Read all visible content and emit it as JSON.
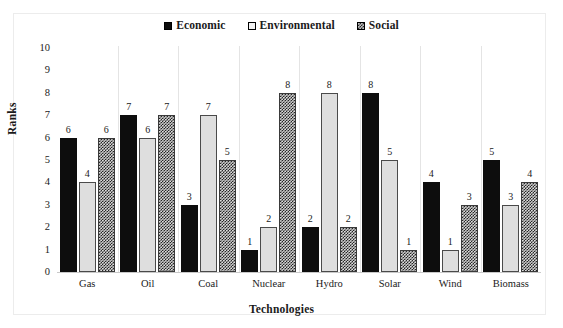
{
  "chart_data": {
    "type": "bar",
    "title": "",
    "xlabel": "Technologies",
    "ylabel": "Ranks",
    "ylim": [
      0,
      10
    ],
    "yticks": [
      10,
      9,
      8,
      7,
      6,
      5,
      4,
      3,
      2,
      1,
      0
    ],
    "grid": "vertical-category-separators",
    "legend_position": "top-center",
    "categories": [
      "Gas",
      "Oil",
      "Coal",
      "Nuclear",
      "Hydro",
      "Solar",
      "Wind",
      "Biomass"
    ],
    "series": [
      {
        "name": "Economic",
        "swatch": "filled-black-square",
        "color": "#0d0d0d",
        "values": [
          6,
          7,
          3,
          1,
          2,
          8,
          4,
          5
        ]
      },
      {
        "name": "Environmental",
        "swatch": "empty-light-square",
        "color": "#dedede",
        "values": [
          4,
          6,
          7,
          2,
          8,
          5,
          1,
          3
        ]
      },
      {
        "name": "Social",
        "swatch": "patterned-square",
        "color": "#b8b8b8",
        "values": [
          6,
          7,
          5,
          8,
          2,
          1,
          3,
          4
        ]
      }
    ]
  }
}
